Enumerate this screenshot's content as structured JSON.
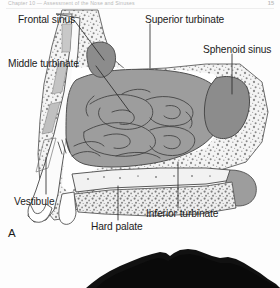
{
  "page": {
    "running_header": "Chapter 10  —  Assessment of the Nose and Sinuses",
    "folio": "15"
  },
  "figure": {
    "panel_a_letter": "A",
    "labels": [
      {
        "id": "frontal-sinus",
        "text": "Frontal sinus"
      },
      {
        "id": "middle-turbinate",
        "text": "Middle turbinate"
      },
      {
        "id": "superior-turbinate",
        "text": "Superior turbinate"
      },
      {
        "id": "sphenoid-sinus",
        "text": "Sphenoid sinus"
      },
      {
        "id": "vestibule",
        "text": "Vestibule"
      },
      {
        "id": "hard-palate",
        "text": "Hard palate"
      },
      {
        "id": "inferior-turbinate",
        "text": "Inferior turbinate"
      }
    ],
    "colors": {
      "mucosa_gray": "#9a9a9a",
      "sinus_cavity_gray": "#8a8a8a",
      "bone_light": "#f0f0f0",
      "outline": "#4a4a4a",
      "leader_line": "#2b2b2b",
      "photo_dark": "#111111"
    }
  }
}
